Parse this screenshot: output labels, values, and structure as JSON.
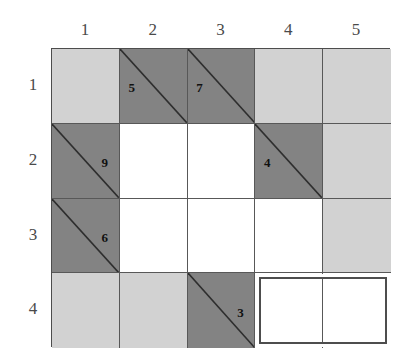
{
  "figure": {
    "name": "grid-puzzle",
    "columns": [
      "1",
      "2",
      "3",
      "4",
      "5"
    ],
    "rows": [
      "1",
      "2",
      "3",
      "4"
    ],
    "colors": {
      "light_fill": "#d2d2d2",
      "dark_fill": "#838383",
      "empty_fill": "#ffffff",
      "line": "#585858",
      "border": "#4d4d4d",
      "clue_text": "#111111",
      "label_text": "#4a4a4a",
      "highlight": "#4d4d4d"
    },
    "geometry": {
      "grid_left": 51,
      "grid_top": 48,
      "cell_width": 67.8,
      "cell_height": 74.75
    },
    "cells": [
      {
        "row": 1,
        "col": 1,
        "fill": "light",
        "diagonal": false,
        "clue": ""
      },
      {
        "row": 1,
        "col": 2,
        "fill": "dark",
        "diagonal": true,
        "clue": "5",
        "clue_pos": "lower-left"
      },
      {
        "row": 1,
        "col": 3,
        "fill": "dark",
        "diagonal": true,
        "clue": "7",
        "clue_pos": "lower-left"
      },
      {
        "row": 1,
        "col": 4,
        "fill": "light",
        "diagonal": false,
        "clue": ""
      },
      {
        "row": 1,
        "col": 5,
        "fill": "light",
        "diagonal": false,
        "clue": ""
      },
      {
        "row": 2,
        "col": 1,
        "fill": "dark",
        "diagonal": true,
        "clue": "9",
        "clue_pos": "upper-right"
      },
      {
        "row": 2,
        "col": 2,
        "fill": "white",
        "diagonal": false,
        "clue": ""
      },
      {
        "row": 2,
        "col": 3,
        "fill": "white",
        "diagonal": false,
        "clue": ""
      },
      {
        "row": 2,
        "col": 4,
        "fill": "dark",
        "diagonal": true,
        "clue": "4",
        "clue_pos": "lower-left"
      },
      {
        "row": 2,
        "col": 5,
        "fill": "light",
        "diagonal": false,
        "clue": ""
      },
      {
        "row": 3,
        "col": 1,
        "fill": "dark",
        "diagonal": true,
        "clue": "6",
        "clue_pos": "upper-right"
      },
      {
        "row": 3,
        "col": 2,
        "fill": "white",
        "diagonal": false,
        "clue": ""
      },
      {
        "row": 3,
        "col": 3,
        "fill": "white",
        "diagonal": false,
        "clue": ""
      },
      {
        "row": 3,
        "col": 4,
        "fill": "white",
        "diagonal": false,
        "clue": ""
      },
      {
        "row": 3,
        "col": 5,
        "fill": "light",
        "diagonal": false,
        "clue": ""
      },
      {
        "row": 4,
        "col": 1,
        "fill": "light",
        "diagonal": false,
        "clue": ""
      },
      {
        "row": 4,
        "col": 2,
        "fill": "light",
        "diagonal": false,
        "clue": ""
      },
      {
        "row": 4,
        "col": 3,
        "fill": "dark",
        "diagonal": true,
        "clue": "3",
        "clue_pos": "upper-right"
      },
      {
        "row": 4,
        "col": 4,
        "fill": "white",
        "diagonal": false,
        "clue": ""
      },
      {
        "row": 4,
        "col": 5,
        "fill": "white",
        "diagonal": false,
        "clue": ""
      }
    ],
    "selection": {
      "label": "selected-region",
      "row": 4,
      "col_start": 4,
      "col_end": 5
    }
  }
}
